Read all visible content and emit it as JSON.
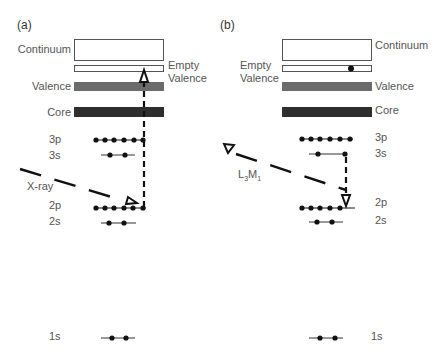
{
  "panels": [
    {
      "tag": "(a)",
      "bands": {
        "continuum": "Continuum",
        "empty_valence": "Empty\nValence",
        "empty_valence_line1": "Empty",
        "empty_valence_line2": "Valence",
        "valence": "Valence",
        "core": "Core"
      },
      "levels": {
        "3p": "3p",
        "3s": "3s",
        "2p": "2p",
        "2s": "2s",
        "1s": "1s"
      },
      "process_label": "X-ray",
      "electron_counts": {
        "3p": 6,
        "3s": 2,
        "2p": 6,
        "2s": 2,
        "1s": 2,
        "empty_valence": 0
      }
    },
    {
      "tag": "(b)",
      "bands": {
        "continuum": "Continuum",
        "empty_valence_line1": "Empty",
        "empty_valence_line2": "Valence",
        "valence": "Valence",
        "core": "Core"
      },
      "levels": {
        "3p": "3p",
        "3s": "3s",
        "2p": "2p",
        "2s": "2s",
        "1s": "1s"
      },
      "process_label_main": "L",
      "process_label_sub1": "3",
      "process_label_mid": "M",
      "process_label_sub2": "1",
      "electron_counts": {
        "3p": 6,
        "3s": 2,
        "2p": 5,
        "2s": 2,
        "1s": 2,
        "empty_valence": 1
      }
    }
  ],
  "colors": {
    "valence_band": "#6b6b6b",
    "core_band": "#2e2e2e",
    "box_border": "#555555",
    "electron": "#111111",
    "label": "#555555"
  }
}
